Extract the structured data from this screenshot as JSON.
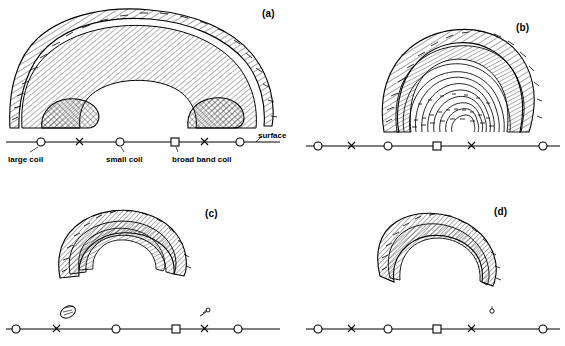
{
  "figure": {
    "type": "line-drawing-diagram",
    "panels": [
      {
        "id": "a",
        "label": "(a)",
        "x": 262,
        "y": 8
      },
      {
        "id": "b",
        "label": "(b)",
        "x": 516,
        "y": 22
      },
      {
        "id": "c",
        "label": "(c)",
        "x": 211,
        "y": 208
      },
      {
        "id": "d",
        "label": "(d)",
        "x": 500,
        "y": 206
      }
    ],
    "annotations": [
      {
        "name": "surface-label",
        "text": "surface",
        "x": 258,
        "y": 132
      },
      {
        "name": "large-coil-label",
        "text": "large  coil",
        "x": 8,
        "y": 158
      },
      {
        "name": "small-coil-label",
        "text": "small  coil",
        "x": 106,
        "y": 158
      },
      {
        "name": "broad-band-coil-label",
        "text": "broad  band  coil",
        "x": 172,
        "y": 158
      }
    ],
    "baselines": [
      {
        "name": "baseline-a",
        "x1": 6,
        "y": 142,
        "x2": 280,
        "markers": [
          {
            "sym": "o",
            "x": 41
          },
          {
            "sym": "x",
            "x": 80
          },
          {
            "sym": "o",
            "x": 120
          },
          {
            "sym": "sq",
            "x": 175
          },
          {
            "sym": "x",
            "x": 205
          },
          {
            "sym": "o",
            "x": 240
          }
        ]
      },
      {
        "name": "baseline-b",
        "x1": 306,
        "y": 146,
        "x2": 560,
        "markers": [
          {
            "sym": "o",
            "x": 318
          },
          {
            "sym": "x",
            "x": 352
          },
          {
            "sym": "o",
            "x": 388
          },
          {
            "sym": "sq",
            "x": 437
          },
          {
            "sym": "x",
            "x": 472
          },
          {
            "sym": "o",
            "x": 543
          }
        ]
      },
      {
        "name": "baseline-c",
        "x1": 6,
        "y": 329,
        "x2": 280,
        "markers": [
          {
            "sym": "o",
            "x": 16
          },
          {
            "sym": "x",
            "x": 57
          },
          {
            "sym": "o",
            "x": 116
          },
          {
            "sym": "sq",
            "x": 176
          },
          {
            "sym": "x",
            "x": 205
          },
          {
            "sym": "o",
            "x": 238
          }
        ]
      },
      {
        "name": "baseline-d",
        "x1": 306,
        "y": 329,
        "x2": 560,
        "markers": [
          {
            "sym": "o",
            "x": 318
          },
          {
            "sym": "x",
            "x": 352
          },
          {
            "sym": "o",
            "x": 388
          },
          {
            "sym": "sq",
            "x": 437
          },
          {
            "sym": "x",
            "x": 472
          },
          {
            "sym": "o",
            "x": 543
          }
        ]
      }
    ],
    "colors": {
      "ink": "#000000",
      "background": "#ffffff"
    }
  }
}
